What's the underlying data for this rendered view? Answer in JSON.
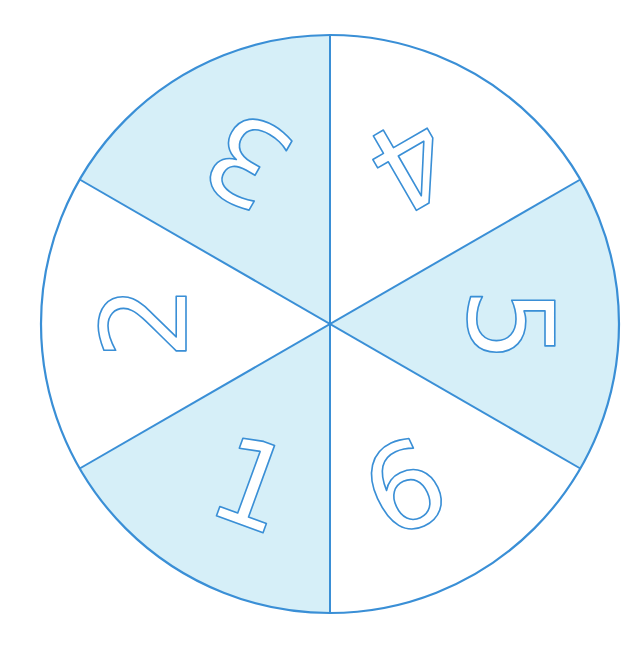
{
  "colors": {
    "shaded_fill": "#d6eff8",
    "unshaded_fill": "#ffffff",
    "stroke": "#3a8fd6",
    "digit_fill": "#ffffff"
  },
  "spinner": {
    "center": [
      330,
      324
    ],
    "radius": 289,
    "sections": [
      {
        "label": "1",
        "shaded": true,
        "position": "bottom-left"
      },
      {
        "label": "2",
        "shaded": false,
        "position": "left"
      },
      {
        "label": "3",
        "shaded": true,
        "position": "top-left"
      },
      {
        "label": "4",
        "shaded": false,
        "position": "top-right"
      },
      {
        "label": "5",
        "shaded": true,
        "position": "right"
      },
      {
        "label": "6",
        "shaded": false,
        "position": "bottom-right"
      }
    ]
  }
}
